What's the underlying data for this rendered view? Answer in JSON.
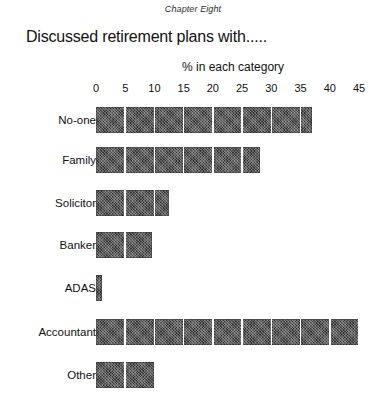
{
  "page": {
    "running_head": "Chapter Eight"
  },
  "chart_data": {
    "type": "bar",
    "orientation": "horizontal",
    "title": "Discussed retirement plans with.....",
    "subtitle": "",
    "xlabel": "% in each category",
    "ylabel": "",
    "categories": [
      "No-one",
      "Family",
      "Solicitor",
      "Banker",
      "ADAS",
      "Accountant",
      "Other"
    ],
    "values": [
      37,
      28,
      12.5,
      9.5,
      1,
      45,
      10
    ],
    "xlim": [
      0,
      45
    ],
    "xticks": [
      0,
      5,
      10,
      15,
      20,
      25,
      30,
      35,
      40,
      45
    ],
    "xtick_labels": [
      "0",
      "5",
      "10",
      "15",
      "20",
      "25",
      "30",
      "35",
      "40",
      "45"
    ],
    "grid": true,
    "legend": false,
    "bar_color": "#2e2e2e",
    "gridline_color": "#ffffff",
    "background_color": "#ffffff"
  }
}
